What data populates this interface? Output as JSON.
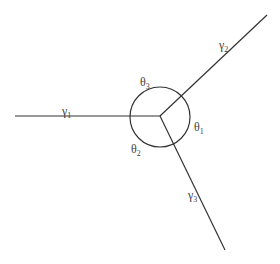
{
  "diagram": {
    "center": {
      "x": 160,
      "y": 116
    },
    "circle": {
      "cx": 160,
      "cy": 117,
      "r": 30
    },
    "stroke_color": "#333333",
    "rays": [
      {
        "name": "gamma1",
        "symbol": "γ",
        "sub": "1",
        "x2": 15,
        "y2": 116,
        "label_x": 62,
        "label_y": 115
      },
      {
        "name": "gamma2",
        "symbol": "γ",
        "sub": "2",
        "x2": 267,
        "y2": 15,
        "label_x": 219,
        "label_y": 49
      },
      {
        "name": "gamma3",
        "symbol": "γ",
        "sub": "3",
        "x2": 225,
        "y2": 250,
        "label_x": 188,
        "label_y": 199
      }
    ],
    "angles": [
      {
        "name": "theta1",
        "symbol": "θ",
        "sub": "1",
        "x": 194,
        "y": 131
      },
      {
        "name": "theta2",
        "symbol": "θ",
        "sub": "2",
        "x": 131,
        "y": 153
      },
      {
        "name": "theta3",
        "symbol": "θ",
        "sub": "3",
        "x": 140,
        "y": 86
      }
    ]
  }
}
